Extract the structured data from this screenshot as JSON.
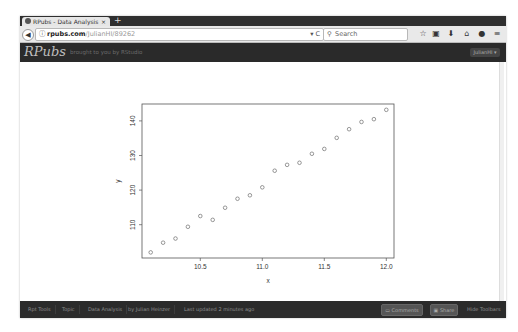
{
  "browser": {
    "tab": {
      "title": "RPubs - Data Analysis",
      "close": "×"
    },
    "new_tab": "+",
    "back": "◀",
    "url": {
      "host": "rpubs.com",
      "path": "/JulianHI/89262"
    },
    "search": {
      "placeholder": "Search"
    },
    "toolbar_icons": [
      "star-icon",
      "clipboard-icon",
      "download-icon",
      "home-icon",
      "chat-icon",
      "menu-icon"
    ]
  },
  "site_header": {
    "logo": "RPubs",
    "tagline": "brought to you by RStudio",
    "user_button": "JulianHI ▾"
  },
  "footer": {
    "links": [
      "Rpt Tools",
      "Topic",
      "Data Analysis",
      "by Julian Heinzer",
      "Last updated 2 minutes ago"
    ],
    "buttons": {
      "comments": "Comments (0)",
      "share": "Share",
      "hide": "Hide Toolbars"
    }
  },
  "chart_data": {
    "type": "scatter",
    "title": "",
    "xlabel": "x",
    "ylabel": "y",
    "xlim": [
      10.07,
      12.07
    ],
    "ylim": [
      100.5,
      145
    ],
    "x_ticks": [
      10.5,
      11.0,
      11.5,
      12.0
    ],
    "x_tick_labels": [
      "10.5",
      "11.0",
      "11.5",
      "12.0"
    ],
    "y_ticks": [
      110,
      120,
      130,
      140
    ],
    "y_tick_labels": [
      "110",
      "120",
      "130",
      "140"
    ],
    "grid": false,
    "marker": "open-circle",
    "x": [
      10.1,
      10.2,
      10.3,
      10.4,
      10.5,
      10.6,
      10.7,
      10.8,
      10.9,
      11.0,
      11.1,
      11.2,
      11.3,
      11.4,
      11.5,
      11.6,
      11.7,
      11.8,
      11.9,
      12.0
    ],
    "y": [
      102.0,
      104.8,
      106.0,
      109.4,
      112.5,
      111.4,
      114.9,
      117.5,
      118.5,
      120.8,
      125.6,
      127.3,
      127.9,
      130.5,
      131.9,
      135.1,
      137.6,
      139.7,
      140.5,
      143.2
    ]
  }
}
